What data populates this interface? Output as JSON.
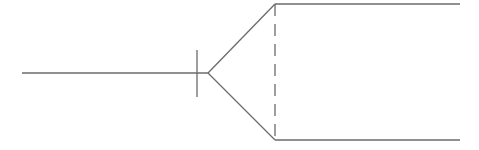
{
  "diagram": {
    "type": "relationship-connector",
    "stroke_color": "#6b6b6b",
    "background": "#ffffff",
    "stem": {
      "x1": 22,
      "y1": 73,
      "x2": 208,
      "y2": 73
    },
    "tick": {
      "x1": 197,
      "y1": 50,
      "x2": 197,
      "y2": 97
    },
    "fork_upper": {
      "x1": 208,
      "y1": 73,
      "x2": 275,
      "y2": 4
    },
    "fork_lower": {
      "x1": 208,
      "y1": 73,
      "x2": 275,
      "y2": 140
    },
    "top_line": {
      "x1": 275,
      "y1": 4,
      "x2": 460,
      "y2": 4
    },
    "bottom_line": {
      "x1": 275,
      "y1": 140,
      "x2": 460,
      "y2": 140
    },
    "dashed_divider": {
      "x1": 275,
      "y1": 4,
      "x2": 275,
      "y2": 140,
      "dash": "12 8"
    }
  }
}
